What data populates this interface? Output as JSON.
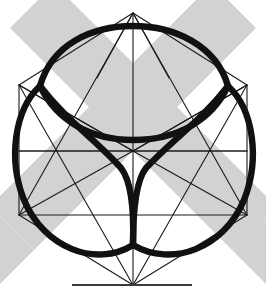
{
  "figure": {
    "background_color": "#ffffff",
    "band_color": "#d2d2d2",
    "thin_line_color": "#1a1a1a",
    "thick_curve_color": "#111111",
    "ground_line_color": "#3a3a3a",
    "canvas": {
      "width": 266,
      "height": 301
    }
  },
  "geometry": {
    "center": {
      "x": 133,
      "y": 151
    },
    "vertices": {
      "top": {
        "x": 133,
        "y": 13
      },
      "upper_left": {
        "x": 19,
        "y": 85
      },
      "upper_right": {
        "x": 247,
        "y": 85
      },
      "lower_left": {
        "x": 19,
        "y": 215
      },
      "lower_right": {
        "x": 247,
        "y": 215
      },
      "bottom": {
        "x": 133,
        "y": 285
      }
    },
    "ground_line": {
      "x1": 72,
      "x2": 192,
      "y": 285
    },
    "band_half_width": 31,
    "curve_cusps": [
      {
        "x": 133,
        "y": 151
      },
      {
        "x": 40,
        "y": 86
      },
      {
        "x": 228,
        "y": 86
      }
    ],
    "lobe_count": 3
  },
  "labels": {
    "figure_name": "",
    "caption": ""
  }
}
